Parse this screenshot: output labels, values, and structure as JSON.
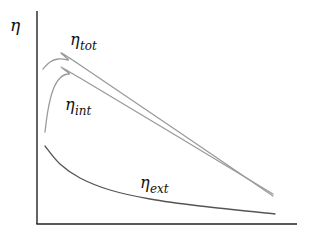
{
  "chart_data": {
    "type": "line",
    "title": "",
    "xlabel": "",
    "ylabel": "η",
    "grid": false,
    "legend": "inline labels",
    "x_ticks": [],
    "y_ticks": [],
    "series": [
      {
        "name": "η_tot",
        "label_main": "η",
        "label_sub": "tot",
        "color": "#9a9a9a",
        "points": [
          [
            43,
            69
          ],
          [
            50,
            62
          ],
          [
            58,
            59
          ],
          [
            68,
            60
          ],
          [
            80,
            65
          ],
          [
            273,
            196
          ]
        ]
      },
      {
        "name": "η_int",
        "label_main": "η",
        "label_sub": "int",
        "color": "#9a9a9a",
        "points": [
          [
            45,
            132
          ],
          [
            48,
            110
          ],
          [
            53,
            90
          ],
          [
            60,
            78
          ],
          [
            69,
            74
          ],
          [
            80,
            78
          ],
          [
            273,
            194
          ]
        ]
      },
      {
        "name": "η_ext",
        "label_main": "η",
        "label_sub": "ext",
        "color": "#555555",
        "points": [
          [
            45,
            146
          ],
          [
            60,
            164
          ],
          [
            80,
            178
          ],
          [
            110,
            190
          ],
          [
            150,
            199
          ],
          [
            200,
            206
          ],
          [
            275,
            214
          ]
        ]
      }
    ],
    "axes": {
      "origin": [
        37,
        224
      ],
      "y_top": 11,
      "x_right": 297,
      "color": "#222222"
    }
  }
}
